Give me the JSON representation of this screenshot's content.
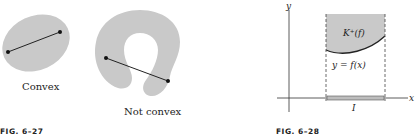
{
  "figure_27": {
    "caption": "FIG. 6–27",
    "convex_label": "Convex",
    "not_convex_label": "Not convex"
  },
  "figure_28": {
    "caption": "FIG. 6–28",
    "y_axis_label": "y",
    "x_axis_label": "x",
    "region_label": "K⁺(f)",
    "curve_label": "y = f(x)",
    "interval_label": "I"
  },
  "colors": {
    "region_fill": "#c9c9c9",
    "ink": "#222222"
  }
}
